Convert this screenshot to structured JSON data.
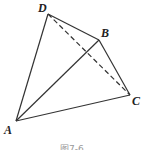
{
  "figure": {
    "caption": "图7-6",
    "points": {
      "A": {
        "label": "A",
        "x": 16,
        "y": 121
      },
      "B": {
        "label": "B",
        "x": 99,
        "y": 40
      },
      "C": {
        "label": "C",
        "x": 130,
        "y": 95
      },
      "D": {
        "label": "D",
        "x": 48,
        "y": 14
      }
    },
    "solid_edges": [
      "AD",
      "DB",
      "AB",
      "BC",
      "AC"
    ],
    "dashed_edges": [
      "DC"
    ],
    "line_color": "#333333"
  }
}
